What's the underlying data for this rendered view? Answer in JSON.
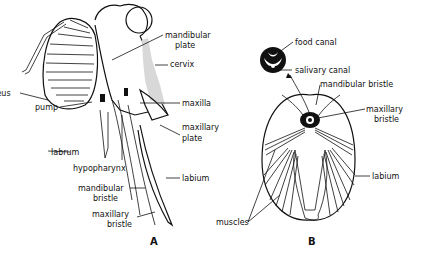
{
  "figure": {
    "panel_a": {
      "letter": "A",
      "labels": {
        "mandibular_plate_1": "mandibular",
        "mandibular_plate_2": "plate",
        "cervix": "cervix",
        "clypeus": "clypeus",
        "pump": "pump",
        "maxilla": "maxilla",
        "maxillary_plate_1": "maxillary",
        "maxillary_plate_2": "plate",
        "labrum": "labrum",
        "hypopharynx": "hypopharynx",
        "labium": "labium",
        "mandibular_bristle_1": "mandibular",
        "mandibular_bristle_2": "bristle",
        "maxillary_bristle_1": "maxillary",
        "maxillary_bristle_2": "bristle"
      }
    },
    "panel_b": {
      "letter": "B",
      "labels": {
        "food_canal": "food canal",
        "salivary_canal": "salivary canal",
        "mandibular_bristle": "mandibular bristle",
        "maxillary_bristle_1": "maxillary",
        "maxillary_bristle_2": "bristle",
        "labium": "labium",
        "muscles": "muscles"
      }
    }
  }
}
